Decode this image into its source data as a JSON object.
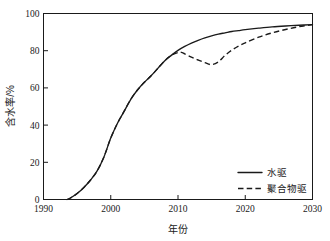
{
  "chart_data": {
    "type": "line",
    "title": "",
    "xlabel": "年份",
    "ylabel": "含水率/%",
    "xlim": [
      1990,
      2030
    ],
    "ylim": [
      0,
      100
    ],
    "xticks": [
      1990,
      2000,
      2010,
      2020,
      2030
    ],
    "yticks": [
      0,
      20,
      40,
      60,
      80,
      100
    ],
    "xtick_labels": [
      "1990",
      "2000",
      "2010",
      "2020",
      "2030"
    ],
    "ytick_labels": [
      "0",
      "20",
      "40",
      "60",
      "80",
      "100"
    ],
    "grid": false,
    "legend_position": "lower right",
    "line_color": "#1a1a1a",
    "series": [
      {
        "name": "水驱",
        "style": "solid",
        "x": [
          1993.5,
          1994,
          1995,
          1996,
          1997,
          1998,
          1999,
          2000,
          2001,
          2002,
          2003,
          2004,
          2005,
          2006,
          2007,
          2008,
          2009,
          2010,
          2011,
          2012,
          2013,
          2014,
          2015,
          2016,
          2017,
          2018,
          2019,
          2020,
          2022,
          2024,
          2026,
          2028,
          2030
        ],
        "values": [
          0,
          0.8,
          3.2,
          6.5,
          10.5,
          15.5,
          23,
          33,
          41,
          47.5,
          54,
          59,
          63,
          66.5,
          70.5,
          74.5,
          77.5,
          80.2,
          82.3,
          84.1,
          85.6,
          86.9,
          88.0,
          88.9,
          89.6,
          90.3,
          90.8,
          91.3,
          92.1,
          92.8,
          93.3,
          93.7,
          94.0
        ]
      },
      {
        "name": "聚合物驱",
        "style": "dashed",
        "x": [
          1993.5,
          1994,
          1995,
          1996,
          1997,
          1998,
          1999,
          2000,
          2001,
          2002,
          2003,
          2004,
          2005,
          2006,
          2007,
          2008,
          2009,
          2010,
          2010.5,
          2011,
          2012,
          2013,
          2014,
          2015,
          2016,
          2017,
          2018,
          2019,
          2020,
          2022,
          2024,
          2026,
          2028,
          2030
        ],
        "values": [
          0,
          0.8,
          3.2,
          6.5,
          10.5,
          15.5,
          23,
          33,
          41,
          47.5,
          54,
          59,
          63,
          66.5,
          70.5,
          74.5,
          77.5,
          79.0,
          79.1,
          78.3,
          76.5,
          75.0,
          73.6,
          72.5,
          74.0,
          77.5,
          80.3,
          82.5,
          84.2,
          87.3,
          89.6,
          91.4,
          92.9,
          94.0
        ]
      }
    ],
    "legend": [
      {
        "label": "水驱",
        "style": "solid"
      },
      {
        "label": "聚合物驱",
        "style": "dashed"
      }
    ]
  }
}
